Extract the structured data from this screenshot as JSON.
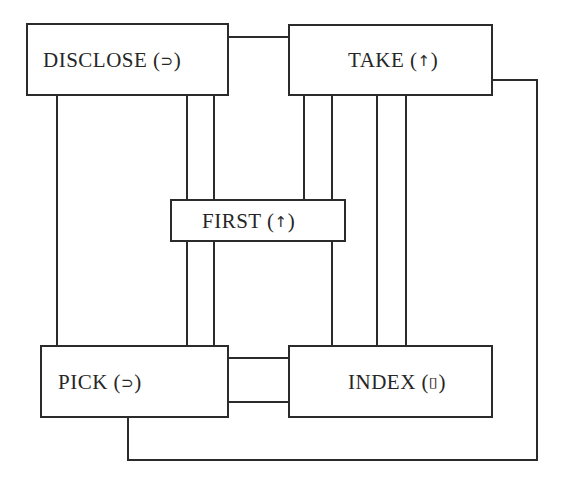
{
  "diagram": {
    "nodes": {
      "disclose": {
        "name": "DISCLOSE",
        "symbol": "⊃"
      },
      "take": {
        "name": "TAKE",
        "symbol": "↑"
      },
      "first": {
        "name": "FIRST",
        "symbol": "↑"
      },
      "pick": {
        "name": "PICK",
        "symbol": "⊃"
      },
      "index": {
        "name": "INDEX",
        "symbol": "⌷"
      }
    },
    "edges": [
      {
        "from": "DISCLOSE",
        "to": "TAKE"
      },
      {
        "from": "DISCLOSE",
        "to": "PICK"
      },
      {
        "from": "DISCLOSE",
        "to": "FIRST"
      },
      {
        "from": "FIRST",
        "to": "PICK"
      },
      {
        "from": "TAKE",
        "to": "FIRST"
      },
      {
        "from": "FIRST",
        "to": "INDEX"
      },
      {
        "from": "TAKE",
        "to": "INDEX"
      },
      {
        "from": "PICK",
        "to": "INDEX"
      },
      {
        "from": "TAKE",
        "to": "PICK"
      }
    ],
    "colors": {
      "line": "#2b2b2b",
      "text": "#262626",
      "background": "#ffffff"
    }
  }
}
